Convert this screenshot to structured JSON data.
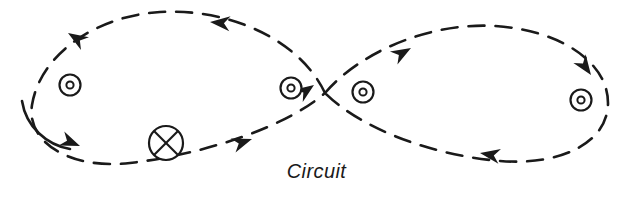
{
  "figure": {
    "caption": "Circuit",
    "type": "figure-eight-circuit-diagram",
    "background_color": "#ffffff",
    "stroke_color": "#1a1a1a",
    "canvas": {
      "width": 633,
      "height": 215
    }
  },
  "symbols": {
    "current_out_of_page": {
      "glyph_name": "dot-in-circle-icon",
      "meaning": "current out of page",
      "count": 4,
      "positions": [
        {
          "label": "left-loop-interior",
          "cx": 70,
          "cy": 85,
          "r_outer": 11,
          "r_inner": 4
        },
        {
          "label": "crossing-left",
          "cx": 291,
          "cy": 88,
          "r_outer": 11,
          "r_inner": 4
        },
        {
          "label": "crossing-right",
          "cx": 363,
          "cy": 92,
          "r_outer": 11,
          "r_inner": 4
        },
        {
          "label": "right-loop-interior",
          "cx": 581,
          "cy": 100,
          "r_outer": 11,
          "r_inner": 4
        }
      ]
    },
    "current_into_page": {
      "glyph_name": "x-in-circle-icon",
      "meaning": "current into page",
      "count": 1,
      "positions": [
        {
          "label": "left-loop-bottom",
          "cx": 166,
          "cy": 143,
          "r": 17
        }
      ]
    }
  },
  "curves": {
    "left_loop": {
      "name": "left-loop-path",
      "style": "dashed",
      "dash_pattern": "16 11",
      "stroke_width": 2.6,
      "path": "M 325 93 C 300 40, 230 8, 160 12 C 95 16, 40 55, 32 105 C 26 142, 70 170, 130 163 C 200 155, 285 128, 325 93"
    },
    "left_loop_solid_tail": {
      "name": "left-loop-solid-segment",
      "style": "solid",
      "stroke_width": 2.6,
      "path": "M 22 102 C 26 128, 48 145, 70 148"
    },
    "right_loop": {
      "name": "right-loop-path",
      "style": "dashed",
      "dash_pattern": "16 11",
      "stroke_width": 2.6,
      "path": "M 325 93 C 360 52, 430 22, 495 26 C 560 30, 608 62, 608 103 C 608 142, 562 166, 500 161 C 430 155, 360 128, 325 93"
    }
  },
  "arrowheads": [
    {
      "name": "arrow-left-loop-top-right",
      "x": 210,
      "y": 22,
      "angle": 185,
      "direction": "left"
    },
    {
      "name": "arrow-left-loop-top-left",
      "x": 68,
      "y": 33,
      "angle": 212,
      "direction": "up-left"
    },
    {
      "name": "arrow-left-loop-bottom-left",
      "x": 79,
      "y": 146,
      "angle": 22,
      "direction": "down-right"
    },
    {
      "name": "arrow-left-loop-bottom-right",
      "x": 251,
      "y": 139,
      "angle": 341,
      "direction": "up-right"
    },
    {
      "name": "arrow-crossing-center",
      "x": 313,
      "y": 85,
      "angle": 325,
      "direction": "up-right"
    },
    {
      "name": "arrow-right-loop-top-left",
      "x": 410,
      "y": 49,
      "angle": 330,
      "direction": "up-right"
    },
    {
      "name": "arrow-right-loop-top-right",
      "x": 590,
      "y": 74,
      "angle": 55,
      "direction": "down-right"
    },
    {
      "name": "arrow-right-loop-bottom",
      "x": 480,
      "y": 153,
      "angle": 190,
      "direction": "left"
    }
  ]
}
